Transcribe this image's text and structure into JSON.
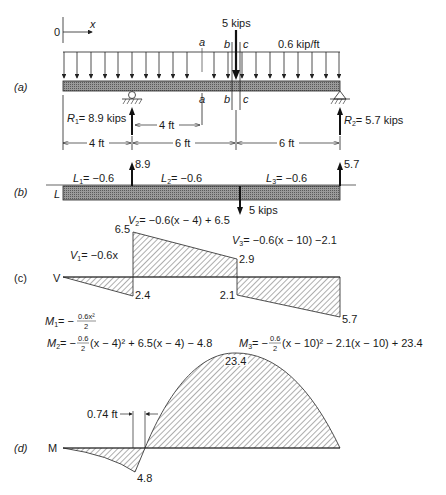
{
  "panels": {
    "a": {
      "label": "(a)",
      "origin_label": "0",
      "x_axis_label": "x",
      "point_load": "5 kips",
      "distributed_load": "0.6 kip/ft",
      "section_a": "a",
      "section_b": "b",
      "section_c": "c",
      "R1": {
        "sym": "R",
        "sub": "1",
        "text": "= 8.9 kips"
      },
      "R2": {
        "sym": "R",
        "sub": "2",
        "text": "= 5.7 kips"
      },
      "dim_inner": "4 ft",
      "dims": [
        "4 ft",
        "6 ft",
        "6 ft"
      ]
    },
    "b": {
      "label": "(b)",
      "axis": "L",
      "L1": {
        "sym": "L",
        "sub": "1",
        "text": "= −0.6"
      },
      "L2": {
        "sym": "L",
        "sub": "2",
        "text": "= −0.6"
      },
      "L3": {
        "sym": "L",
        "sub": "3",
        "text": "= −0.6"
      },
      "up_left": "8.9",
      "up_right": "5.7",
      "down": "5 kips"
    },
    "c": {
      "label": "(c)",
      "axis": "V",
      "V1": {
        "sym": "V",
        "sub": "1",
        "text": "= −0.6x"
      },
      "V2": {
        "sym": "V",
        "sub": "2",
        "text": "= −0.6(x − 4) + 6.5"
      },
      "V3": {
        "sym": "V",
        "sub": "3",
        "text": "= −0.6(x − 10) −2.1"
      },
      "values": {
        "v_2_4": "2.4",
        "v_6_5": "6.5",
        "v_2_9": "2.9",
        "v_2_1": "2.1",
        "v_5_7": "5.7"
      }
    },
    "d": {
      "label": "(d)",
      "axis": "M",
      "M1": {
        "sym": "M",
        "sub": "1",
        "pre": "= −",
        "num": "0.6x²",
        "den": "2"
      },
      "M2": {
        "sym": "M",
        "sub": "2",
        "pre": "= −",
        "num": "0.6",
        "den": "2",
        "post": "(x − 4)² + 6.5(x − 4) − 4.8"
      },
      "M3": {
        "sym": "M",
        "sub": "3",
        "pre": "= −",
        "num": "0.6",
        "den": "2",
        "post": "(x − 10)² − 2.1(x − 10) + 23.4"
      },
      "values": {
        "min": "4.8",
        "max": "23.4"
      },
      "zero_offset": "0.74 ft"
    }
  }
}
